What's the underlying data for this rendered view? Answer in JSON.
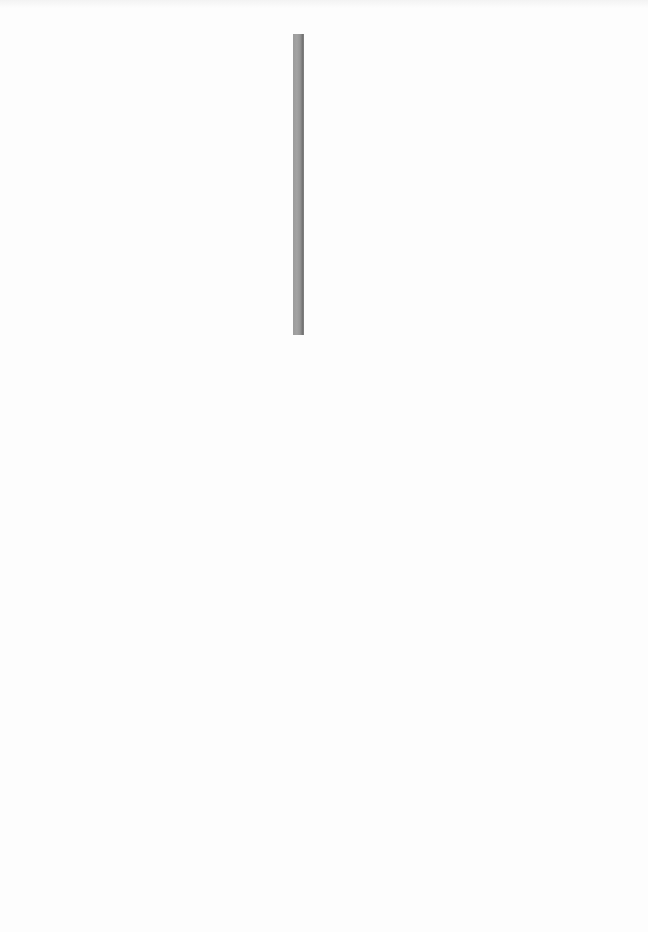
{
  "page": {
    "background_color": "#fdfdfd",
    "description": ""
  },
  "vertical_bar": {
    "color": "#9c9c9c",
    "edge_color": "#6f6f6f",
    "x": 293,
    "y": 34,
    "width": 11,
    "height": 301
  }
}
